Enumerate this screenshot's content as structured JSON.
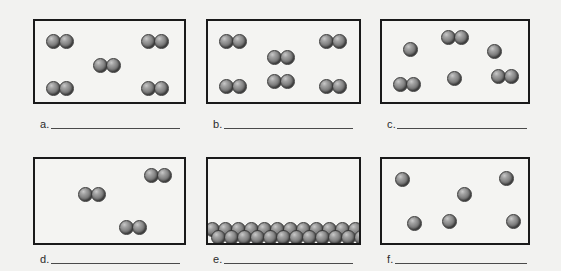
{
  "page": {
    "background_color": "#f2f2f0",
    "box_border_color": "#1a1a1a",
    "atom_fill_color": "#7d7d7d",
    "atom_highlight_color": "#c9c9c9",
    "blank_line_color": "#4a4a4a"
  },
  "panels": [
    {
      "id": "a",
      "label_letter": "a.",
      "blank_answer": "",
      "box": {
        "x": 33,
        "y": 19,
        "w": 153,
        "h": 85
      },
      "description": "Five diatomic molecules evenly spread out",
      "particle_count": 10,
      "molecule_count": 5,
      "single_atom_count": 0,
      "atom_diameter": 15,
      "molecules": [
        {
          "type": "diatomic",
          "atoms": [
            {
              "cx": 18,
              "cy": 20
            },
            {
              "cx": 31,
              "cy": 20
            }
          ]
        },
        {
          "type": "diatomic",
          "atoms": [
            {
              "cx": 113,
              "cy": 20
            },
            {
              "cx": 126,
              "cy": 20
            }
          ]
        },
        {
          "type": "diatomic",
          "atoms": [
            {
              "cx": 65,
              "cy": 44
            },
            {
              "cx": 78,
              "cy": 44
            }
          ]
        },
        {
          "type": "diatomic",
          "atoms": [
            {
              "cx": 18,
              "cy": 67
            },
            {
              "cx": 31,
              "cy": 67
            }
          ]
        },
        {
          "type": "diatomic",
          "atoms": [
            {
              "cx": 113,
              "cy": 67
            },
            {
              "cx": 126,
              "cy": 67
            }
          ]
        }
      ]
    },
    {
      "id": "b",
      "label_letter": "b.",
      "blank_answer": "",
      "box": {
        "x": 206,
        "y": 19,
        "w": 155,
        "h": 85
      },
      "description": "Six diatomic molecules more densely packed",
      "particle_count": 12,
      "molecule_count": 6,
      "single_atom_count": 0,
      "atom_diameter": 15,
      "molecules": [
        {
          "type": "diatomic",
          "atoms": [
            {
              "cx": 18,
              "cy": 20
            },
            {
              "cx": 31,
              "cy": 20
            }
          ]
        },
        {
          "type": "diatomic",
          "atoms": [
            {
              "cx": 118,
              "cy": 20
            },
            {
              "cx": 131,
              "cy": 20
            }
          ]
        },
        {
          "type": "diatomic",
          "atoms": [
            {
              "cx": 66,
              "cy": 36
            },
            {
              "cx": 79,
              "cy": 36
            }
          ]
        },
        {
          "type": "diatomic",
          "atoms": [
            {
              "cx": 18,
              "cy": 65
            },
            {
              "cx": 31,
              "cy": 65
            }
          ]
        },
        {
          "type": "diatomic",
          "atoms": [
            {
              "cx": 66,
              "cy": 60
            },
            {
              "cx": 79,
              "cy": 60
            }
          ]
        },
        {
          "type": "diatomic",
          "atoms": [
            {
              "cx": 118,
              "cy": 65
            },
            {
              "cx": 131,
              "cy": 65
            }
          ]
        }
      ]
    },
    {
      "id": "c",
      "label_letter": "c.",
      "blank_answer": "",
      "box": {
        "x": 380,
        "y": 19,
        "w": 150,
        "h": 85
      },
      "description": "Mixture of three diatomic molecules and three single atoms",
      "particle_count": 9,
      "molecule_count": 3,
      "single_atom_count": 3,
      "atom_diameter": 15,
      "molecules": [
        {
          "type": "diatomic",
          "atoms": [
            {
              "cx": 66,
              "cy": 16
            },
            {
              "cx": 79,
              "cy": 16
            }
          ]
        },
        {
          "type": "monatomic",
          "atoms": [
            {
              "cx": 28,
              "cy": 28
            }
          ]
        },
        {
          "type": "monatomic",
          "atoms": [
            {
              "cx": 112,
              "cy": 30
            }
          ]
        },
        {
          "type": "diatomic",
          "atoms": [
            {
              "cx": 18,
              "cy": 63
            },
            {
              "cx": 31,
              "cy": 63
            }
          ]
        },
        {
          "type": "monatomic",
          "atoms": [
            {
              "cx": 72,
              "cy": 57
            }
          ]
        },
        {
          "type": "diatomic",
          "atoms": [
            {
              "cx": 116,
              "cy": 55
            },
            {
              "cx": 129,
              "cy": 55
            }
          ]
        }
      ]
    },
    {
      "id": "d",
      "label_letter": "d.",
      "blank_answer": "",
      "box": {
        "x": 33,
        "y": 157,
        "w": 153,
        "h": 88
      },
      "description": "Three diatomic molecules, very sparse",
      "particle_count": 6,
      "molecule_count": 3,
      "single_atom_count": 0,
      "atom_diameter": 15,
      "molecules": [
        {
          "type": "diatomic",
          "atoms": [
            {
              "cx": 116,
              "cy": 16
            },
            {
              "cx": 129,
              "cy": 16
            }
          ]
        },
        {
          "type": "diatomic",
          "atoms": [
            {
              "cx": 50,
              "cy": 35
            },
            {
              "cx": 63,
              "cy": 35
            }
          ]
        },
        {
          "type": "diatomic",
          "atoms": [
            {
              "cx": 91,
              "cy": 68
            },
            {
              "cx": 104,
              "cy": 68
            }
          ]
        }
      ]
    },
    {
      "id": "e",
      "label_letter": "e.",
      "blank_answer": "",
      "box": {
        "x": 206,
        "y": 157,
        "w": 155,
        "h": 88
      },
      "description": "Densely packed single atoms settled in two rows at the bottom",
      "particle_count": 24,
      "molecule_count": 0,
      "single_atom_count": 24,
      "atom_diameter": 15,
      "packed_rows": [
        {
          "y": 70,
          "x_start": 4,
          "count": 12,
          "spacing": 13
        },
        {
          "y": 78,
          "x_start": 10,
          "count": 12,
          "spacing": 13
        }
      ]
    },
    {
      "id": "f",
      "label_letter": "f.",
      "blank_answer": "",
      "box": {
        "x": 380,
        "y": 157,
        "w": 150,
        "h": 88
      },
      "description": "Six single atoms scattered far apart",
      "particle_count": 6,
      "molecule_count": 0,
      "single_atom_count": 6,
      "atom_diameter": 15,
      "molecules": [
        {
          "type": "monatomic",
          "atoms": [
            {
              "cx": 20,
              "cy": 20
            }
          ]
        },
        {
          "type": "monatomic",
          "atoms": [
            {
              "cx": 124,
              "cy": 19
            }
          ]
        },
        {
          "type": "monatomic",
          "atoms": [
            {
              "cx": 82,
              "cy": 35
            }
          ]
        },
        {
          "type": "monatomic",
          "atoms": [
            {
              "cx": 32,
              "cy": 64
            }
          ]
        },
        {
          "type": "monatomic",
          "atoms": [
            {
              "cx": 67,
              "cy": 62
            }
          ]
        },
        {
          "type": "monatomic",
          "atoms": [
            {
              "cx": 131,
              "cy": 62
            }
          ]
        }
      ]
    }
  ],
  "labels": {
    "rows": [
      {
        "x": 40,
        "y": 119,
        "w": 140
      },
      {
        "x": 213,
        "y": 119,
        "w": 140
      },
      {
        "x": 387,
        "y": 119,
        "w": 140
      },
      {
        "x": 40,
        "y": 254,
        "w": 140
      },
      {
        "x": 213,
        "y": 254,
        "w": 140
      },
      {
        "x": 387,
        "y": 254,
        "w": 140
      }
    ]
  }
}
